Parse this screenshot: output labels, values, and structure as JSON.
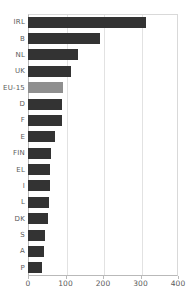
{
  "chart": {
    "type": "bar",
    "orientation": "horizontal",
    "title": "",
    "subtitle": "",
    "xlabel": "",
    "ylabel": "",
    "xlim": [
      0,
      400
    ],
    "xticks": [
      0,
      100,
      200,
      300,
      400
    ],
    "grid": true,
    "legend": null,
    "colors": {
      "bar": "#333333",
      "highlight": "#8f8f8f",
      "grid": "#e2e2e2",
      "axis": "#b9b9b9",
      "text": "#5a5a5a",
      "background": "#ffffff"
    },
    "highlight_category": "EU-15"
  },
  "chart_data": {
    "type": "bar",
    "orientation": "horizontal",
    "title": "",
    "xlabel": "",
    "ylabel": "",
    "xlim": [
      0,
      400
    ],
    "xticks": [
      "0",
      "100",
      "200",
      "300",
      "400"
    ],
    "grid": true,
    "categories": [
      "IRL",
      "B",
      "NL",
      "UK",
      "EU-15",
      "D",
      "F",
      "E",
      "FIN",
      "EL",
      "I",
      "L",
      "DK",
      "S",
      "A",
      "P"
    ],
    "values": [
      315,
      192,
      133,
      115,
      93,
      91,
      90,
      72,
      60,
      59,
      59,
      57,
      52,
      45,
      43,
      37
    ],
    "highlighted": [
      "EU-15"
    ]
  }
}
